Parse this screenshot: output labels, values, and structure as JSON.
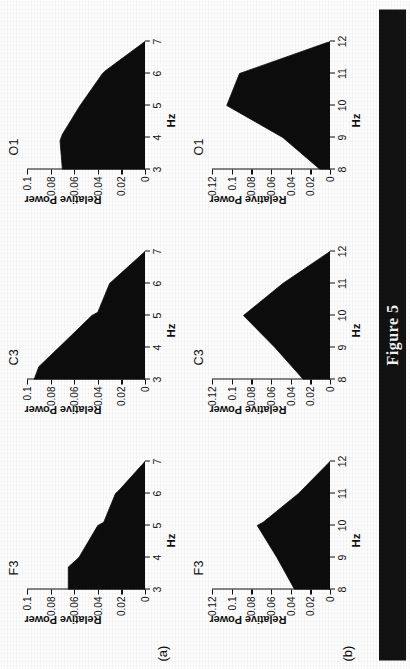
{
  "caption": "Figure 5",
  "axis": {
    "ylabel": "Relative Power",
    "xlabel": "Hz"
  },
  "rows": [
    {
      "tag": "(a)",
      "xticks": [
        "3",
        "4",
        "5",
        "6",
        "7"
      ],
      "yticks": [
        "0",
        "0.02",
        "0.04",
        "0.06",
        "0.08",
        "0.1"
      ],
      "panels": [
        {
          "title": "F3"
        },
        {
          "title": "C3"
        },
        {
          "title": "O1"
        }
      ]
    },
    {
      "tag": "(b)",
      "xticks": [
        "8",
        "9",
        "10",
        "11",
        "12"
      ],
      "yticks": [
        "0",
        "0.02",
        "0.04",
        "0.06",
        "0.08",
        "0.1",
        "0.12"
      ],
      "panels": [
        {
          "title": "F3"
        },
        {
          "title": "C3"
        },
        {
          "title": "O1"
        }
      ]
    }
  ],
  "chart_data": [
    {
      "type": "area",
      "title": "F3",
      "panel": "(a)",
      "xlabel": "Hz",
      "ylabel": "Relative Power",
      "xlim": [
        3,
        7
      ],
      "ylim": [
        0,
        0.1
      ],
      "xticks": [
        3,
        4,
        5,
        6,
        7
      ],
      "yticks": [
        0,
        0.02,
        0.04,
        0.06,
        0.08,
        0.1
      ],
      "grid": false,
      "legend": "none",
      "x": [
        3.0,
        3.7,
        4.0,
        5.0,
        5.1,
        6.0,
        6.1,
        7.0
      ],
      "values": [
        0.065,
        0.065,
        0.056,
        0.04,
        0.035,
        0.025,
        0.022,
        0.0
      ]
    },
    {
      "type": "area",
      "title": "C3",
      "panel": "(a)",
      "xlabel": "Hz",
      "ylabel": "Relative Power",
      "xlim": [
        3,
        7
      ],
      "ylim": [
        0,
        0.1
      ],
      "xticks": [
        3,
        4,
        5,
        6,
        7
      ],
      "yticks": [
        0,
        0.02,
        0.04,
        0.06,
        0.08,
        0.1
      ],
      "grid": false,
      "legend": "none",
      "x": [
        3.0,
        3.4,
        4.0,
        5.0,
        5.1,
        6.0,
        6.1,
        7.0
      ],
      "values": [
        0.094,
        0.09,
        0.073,
        0.045,
        0.04,
        0.03,
        0.027,
        0.0
      ]
    },
    {
      "type": "area",
      "title": "O1",
      "panel": "(a)",
      "xlabel": "Hz",
      "ylabel": "Relative Power",
      "xlim": [
        3,
        7
      ],
      "ylim": [
        0,
        0.1
      ],
      "xticks": [
        3,
        4,
        5,
        6,
        7
      ],
      "yticks": [
        0,
        0.02,
        0.04,
        0.06,
        0.08,
        0.1
      ],
      "grid": false,
      "legend": "none",
      "x": [
        3.0,
        3.9,
        4.1,
        5.0,
        6.0,
        6.1,
        7.0
      ],
      "values": [
        0.07,
        0.072,
        0.07,
        0.055,
        0.036,
        0.033,
        0.0
      ]
    },
    {
      "type": "area",
      "title": "F3",
      "panel": "(b)",
      "xlabel": "Hz",
      "ylabel": "Relative Power",
      "xlim": [
        8,
        12
      ],
      "ylim": [
        0,
        0.12
      ],
      "xticks": [
        8,
        9,
        10,
        11,
        12
      ],
      "yticks": [
        0,
        0.02,
        0.04,
        0.06,
        0.08,
        0.1,
        0.12
      ],
      "grid": false,
      "legend": "none",
      "x": [
        8.0,
        9.0,
        10.0,
        10.1,
        11.0,
        12.0
      ],
      "values": [
        0.036,
        0.054,
        0.074,
        0.068,
        0.032,
        0.0
      ]
    },
    {
      "type": "area",
      "title": "C3",
      "panel": "(b)",
      "xlabel": "Hz",
      "ylabel": "Relative Power",
      "xlim": [
        8,
        12
      ],
      "ylim": [
        0,
        0.12
      ],
      "xticks": [
        8,
        9,
        10,
        11,
        12
      ],
      "yticks": [
        0,
        0.02,
        0.04,
        0.06,
        0.08,
        0.1,
        0.12
      ],
      "grid": false,
      "legend": "none",
      "x": [
        8.0,
        9.0,
        10.0,
        11.0,
        12.0
      ],
      "values": [
        0.027,
        0.056,
        0.088,
        0.048,
        0.0
      ]
    },
    {
      "type": "area",
      "title": "O1",
      "panel": "(b)",
      "xlabel": "Hz",
      "ylabel": "Relative Power",
      "xlim": [
        8,
        12
      ],
      "ylim": [
        0,
        0.12
      ],
      "xticks": [
        8,
        9,
        10,
        11,
        12
      ],
      "yticks": [
        0,
        0.02,
        0.04,
        0.06,
        0.08,
        0.1,
        0.12
      ],
      "grid": false,
      "legend": "none",
      "x": [
        8.0,
        9.0,
        10.0,
        11.0,
        12.0
      ],
      "values": [
        0.01,
        0.048,
        0.105,
        0.092,
        0.0
      ]
    }
  ],
  "colors": {
    "ink": "#111111",
    "fill": "#0d0d0d",
    "band": "#121212",
    "band_text": "#f2f2f2",
    "paper": "#fdfdfd"
  }
}
